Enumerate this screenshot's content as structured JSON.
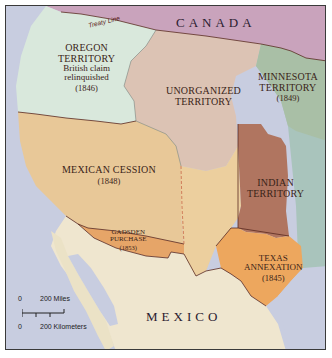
{
  "map": {
    "title": "Territorial expansion of the western United States",
    "countries": [
      {
        "id": "canada",
        "label": "CANADA"
      },
      {
        "id": "mexico",
        "label": "MEXICO"
      }
    ],
    "boundary_labels": {
      "treaty_line": "Treaty Line"
    },
    "regions": [
      {
        "id": "oregon",
        "name_line1": "OREGON",
        "name_line2": "TERRITORY",
        "note_line1": "British claim",
        "note_line2": "relinquished",
        "year": "(1846)",
        "color": "#d9e8dc"
      },
      {
        "id": "unorganized",
        "name_line1": "UNORGANIZED",
        "name_line2": "TERRITORY",
        "color": "#dcc3b4"
      },
      {
        "id": "minnesota",
        "name_line1": "MINNESOTA",
        "name_line2": "TERRITORY",
        "year": "(1849)",
        "color": "#a9bfa6"
      },
      {
        "id": "mexican_cession",
        "name_line1": "MEXICAN CESSION",
        "year": "(1848)",
        "color": "#e8c898"
      },
      {
        "id": "indian",
        "name_line1": "INDIAN",
        "name_line2": "TERRITORY",
        "color": "#b07560"
      },
      {
        "id": "gadsden",
        "name_line1": "GADSDEN",
        "name_line2": "PURCHASE",
        "year": "(1853)",
        "color": "#e6a568"
      },
      {
        "id": "texas",
        "name_line1": "TEXAS",
        "name_line2": "ANNEXATION",
        "year": "(1845)",
        "color": "#eda75e"
      }
    ],
    "other_colors": {
      "canada": "#c9a3bc",
      "ocean": "#c8cde0",
      "mexico": "#efe6cf",
      "eastern_states": "#a9c4bc",
      "border": "#5a2a20"
    },
    "scale": {
      "miles_zero": "0",
      "miles_label": "200 Miles",
      "km_zero": "0",
      "km_label": "200 Kilometers"
    }
  }
}
